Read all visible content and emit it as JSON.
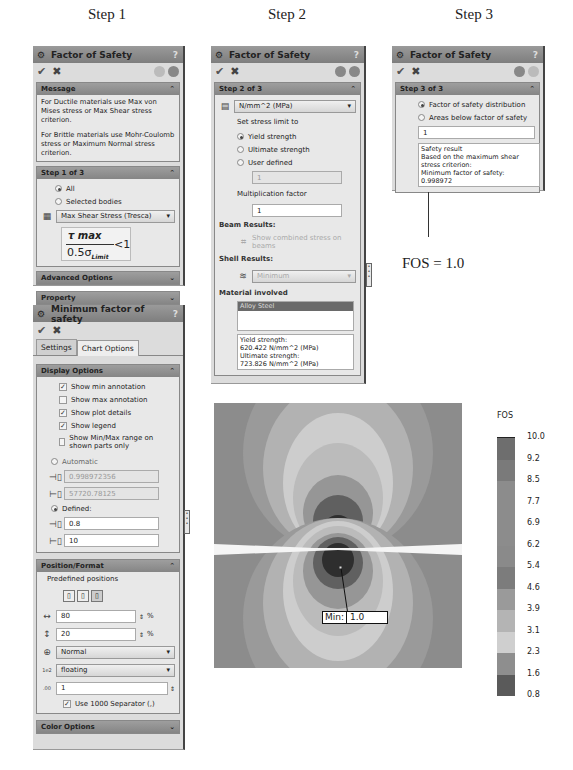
{
  "step_titles": [
    "Step 1",
    "Step 2",
    "Step 3"
  ],
  "step1": {
    "title": "Factor of Safety",
    "help": "?",
    "message_section": {
      "label": "Message",
      "text1": "For Ductile materials use Max von Mises stress or Max Shear stress criterion.",
      "text2": "For Brittle materials use Mohr-Coulomb stress or Maximum Normal stress criterion."
    },
    "step_section": {
      "label": "Step 1 of 3",
      "radio_all": "All",
      "radio_selected": "Selected bodies",
      "criterion": "Max Shear Stress (Tresca)",
      "formula_num": "τ max",
      "formula_den": "0.5σ",
      "formula_sub": "Limit",
      "formula_rhs": "<1"
    },
    "advanced_label": "Advanced Options",
    "property_label": "Property"
  },
  "min_fos": {
    "title": "Minimum factor of safety",
    "help": "?",
    "tabs": [
      "Settings",
      "Chart Options"
    ],
    "display_options": {
      "label": "Display Options",
      "checks": [
        {
          "label": "Show min annotation",
          "checked": true
        },
        {
          "label": "Show max annotation",
          "checked": false
        },
        {
          "label": "Show plot details",
          "checked": true
        },
        {
          "label": "Show legend",
          "checked": true
        },
        {
          "label": "Show Min/Max range on shown parts only",
          "checked": false
        }
      ],
      "automatic_label": "Automatic",
      "auto_min": "0.998972356",
      "auto_max": "57720.78125",
      "defined_label": "Defined:",
      "defined_min": "0.8",
      "defined_max": "10"
    },
    "position_format": {
      "label": "Position/Format",
      "predefined_label": "Predefined positions",
      "x_pos": "80",
      "y_pos": "20",
      "percent": "%",
      "number_format": "Normal",
      "float_format": "floating",
      "decimals": "1",
      "separator_label": "Use 1000 Separator (,)"
    },
    "color_options_label": "Color Options"
  },
  "step2": {
    "title": "Factor of Safety",
    "help": "?",
    "section_label": "Step 2 of 3",
    "units": "N/mm^2 (MPa)",
    "set_limit_label": "Set stress limit to",
    "radios": [
      {
        "label": "Yield strength",
        "selected": true
      },
      {
        "label": "Ultimate strength",
        "selected": false
      },
      {
        "label": "User defined",
        "selected": false
      }
    ],
    "user_defined_value": "1",
    "mult_factor_label": "Multiplication factor",
    "mult_factor_value": "1",
    "beam_results_label": "Beam Results:",
    "beam_option": "Show combined stress on beams",
    "shell_results_label": "Shell Results:",
    "shell_option": "Minimum",
    "material_label": "Material involved",
    "material_selected": "Alloy Steel",
    "material_info": [
      "Yield strength:",
      "620.422 N/mm^2 (MPa)",
      "Ultimate strength:",
      "723.826 N/mm^2 (MPa)"
    ]
  },
  "step3": {
    "title": "Factor of Safety",
    "help": "?",
    "section_label": "Step 3 of 3",
    "radio_distribution": "Factor of safety distribution",
    "radio_areas": "Areas below factor of safety",
    "value": "1",
    "result_lines": [
      "Safety result",
      "Based on the maximum shear stress criterion:",
      "Minimum factor of safety:",
      "0.998972"
    ]
  },
  "annotation": {
    "fos_label": "FOS = 1.0",
    "min_label": "Min:",
    "min_value": "1.0"
  },
  "legend": {
    "title": "FOS",
    "ticks": [
      "10.0",
      "9.2",
      "8.5",
      "7.7",
      "6.9",
      "6.2",
      "5.4",
      "4.6",
      "3.9",
      "3.1",
      "2.3",
      "1.6",
      "0.8"
    ],
    "band_colors": [
      "#6e6e6e",
      "#7a7a7a",
      "#8c8c8c",
      "#8c8c8c",
      "#8c8c8c",
      "#8a8a8a",
      "#7c7c7c",
      "#9a9a9a",
      "#b4b4b4",
      "#cfcfcf",
      "#8e8e8e",
      "#5a5a5a",
      "#2e2e2e"
    ]
  }
}
